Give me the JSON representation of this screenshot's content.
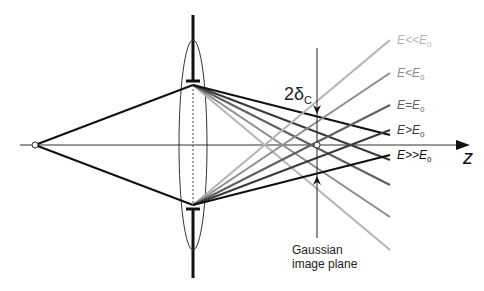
{
  "diagram": {
    "axis_label": "z",
    "spot_label_main": "2δ",
    "spot_label_sub": "C",
    "image_plane_label_line1": "Gaussian",
    "image_plane_label_line2": "image plane",
    "rays": [
      {
        "label_main": "E<<E",
        "label_sub": "0",
        "color": "#b4b4b4",
        "y_top_end": 40,
        "y_bot_end": 250
      },
      {
        "label_main": "E<E",
        "label_sub": "0",
        "color": "#8c8c8c",
        "y_top_end": 73,
        "y_bot_end": 217
      },
      {
        "label_main": "E=E",
        "label_sub": "0",
        "color": "#5f5f5f",
        "y_top_end": 105,
        "y_bot_end": 185
      },
      {
        "label_main": "E>E",
        "label_sub": "0",
        "color": "#3a3a3a",
        "y_top_end": 130,
        "y_bot_end": 160
      },
      {
        "label_main": "E>>E",
        "label_sub": "0",
        "color": "#111111",
        "y_top_end": 155,
        "y_bot_end": 135
      }
    ]
  }
}
